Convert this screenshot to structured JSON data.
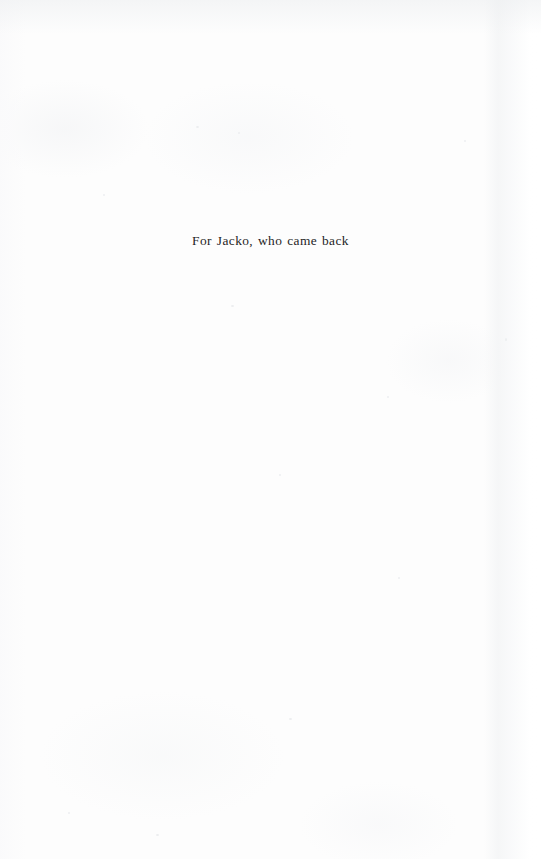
{
  "page": {
    "kind": "book-dedication-page",
    "background_color": "#fdfdfd",
    "ink_color": "#1f1f1f"
  },
  "dedication": {
    "text": "For Jacko, who came back"
  }
}
